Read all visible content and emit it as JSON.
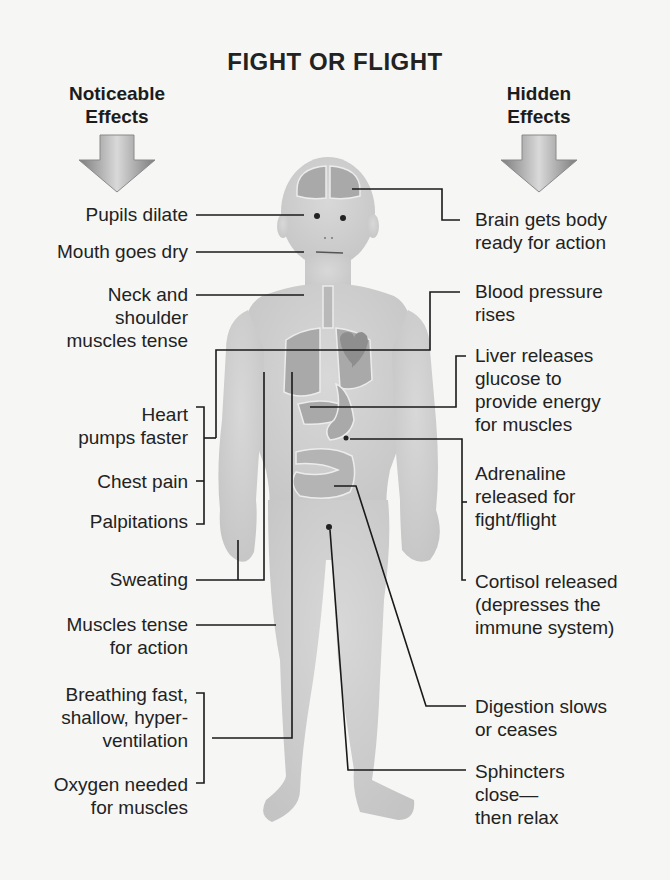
{
  "title": "FIGHT OR FLIGHT",
  "columns": {
    "left": {
      "line1": "Noticeable",
      "line2": "Effects",
      "arrow_icon": "down-arrow-icon"
    },
    "right": {
      "line1": "Hidden",
      "line2": "Effects",
      "arrow_icon": "down-arrow-icon"
    }
  },
  "noticeable_effects": [
    {
      "lines": [
        "Pupils dilate"
      ]
    },
    {
      "lines": [
        "Mouth goes dry"
      ]
    },
    {
      "lines": [
        "Neck and",
        "shoulder",
        "muscles tense"
      ]
    },
    {
      "lines": [
        "Heart",
        "pumps faster"
      ]
    },
    {
      "lines": [
        "Chest pain"
      ]
    },
    {
      "lines": [
        "Palpitations"
      ]
    },
    {
      "lines": [
        "Sweating"
      ]
    },
    {
      "lines": [
        "Muscles tense",
        "for action"
      ]
    },
    {
      "lines": [
        "Breathing fast,",
        "shallow, hyper-",
        "ventilation"
      ]
    },
    {
      "lines": [
        "Oxygen needed",
        "for muscles"
      ]
    }
  ],
  "hidden_effects": [
    {
      "lines": [
        "Brain gets body",
        "ready for action"
      ]
    },
    {
      "lines": [
        "Blood pressure",
        "rises"
      ]
    },
    {
      "lines": [
        "Liver releases",
        "glucose to",
        "provide energy",
        "for muscles"
      ]
    },
    {
      "lines": [
        "Adrenaline",
        "released for",
        "fight/flight"
      ]
    },
    {
      "lines": [
        "Cortisol released",
        "(depresses the",
        "immune system)"
      ]
    },
    {
      "lines": [
        "Digestion slows",
        "or ceases"
      ]
    },
    {
      "lines": [
        "Sphincters",
        "close—",
        "then relax"
      ]
    }
  ],
  "colors": {
    "background": "#f6f6f4",
    "body": "#cfcfcf",
    "organ": "#a9a9a9",
    "heart": "#8e8e8e",
    "line": "#1a1a1a",
    "arrow": "#9a9a9a"
  }
}
